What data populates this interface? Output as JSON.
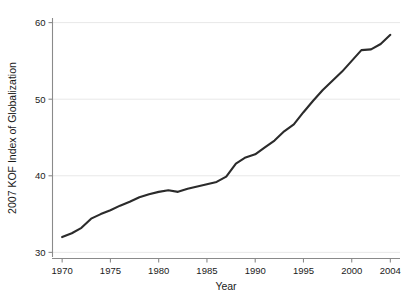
{
  "chart_data": {
    "type": "line",
    "title": "",
    "xlabel": "Year",
    "ylabel": "2007 KOF Index of Globalization",
    "xlim": [
      1969,
      2005
    ],
    "ylim": [
      29.2,
      60.6
    ],
    "xticks": [
      1970,
      1975,
      1980,
      1985,
      1990,
      1995,
      2000,
      2004
    ],
    "xtick_labels": [
      "1970",
      "1975",
      "1980",
      "1985",
      "1990",
      "1995",
      "2000",
      "2004"
    ],
    "yticks": [
      30,
      40,
      50,
      60
    ],
    "ytick_labels": [
      "30",
      "40",
      "50",
      "60"
    ],
    "grid": "horizontal",
    "legend": "none",
    "line_color": "#2b2b2b",
    "grid_color": "#e8e8e8",
    "axis_color": "#8a8a8a",
    "background_color": "#ffffff",
    "series": [
      {
        "name": "2007 KOF Index of Globalization",
        "x": [
          1970,
          1971,
          1972,
          1973,
          1974,
          1975,
          1976,
          1977,
          1978,
          1979,
          1980,
          1981,
          1982,
          1983,
          1984,
          1985,
          1986,
          1987,
          1988,
          1989,
          1990,
          1991,
          1992,
          1993,
          1994,
          1995,
          1996,
          1997,
          1998,
          1999,
          2000,
          2001,
          2002,
          2003,
          2004
        ],
        "values": [
          32.0,
          32.5,
          33.2,
          34.4,
          35.0,
          35.5,
          36.1,
          36.6,
          37.2,
          37.6,
          37.9,
          38.1,
          37.9,
          38.3,
          38.6,
          38.9,
          39.2,
          39.9,
          41.6,
          42.4,
          42.8,
          43.7,
          44.6,
          45.8,
          46.7,
          48.3,
          49.8,
          51.2,
          52.4,
          53.6,
          55.0,
          56.4,
          56.5,
          57.2,
          58.4
        ]
      }
    ]
  },
  "axis": {
    "x_title": "Year",
    "y_title": "2007 KOF Index of Globalization"
  }
}
